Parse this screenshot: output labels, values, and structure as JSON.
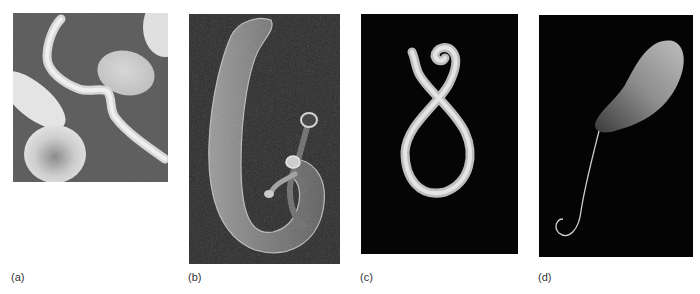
{
  "figure": {
    "panels": [
      {
        "id": "a",
        "label": "(a)",
        "subject": "trypanosome-among-red-blood-cells",
        "background": "#5b5b5b"
      },
      {
        "id": "b",
        "label": "(b)",
        "subject": "schistosome-fluke-pair",
        "background": "#2a2a2a"
      },
      {
        "id": "c",
        "label": "(c)",
        "subject": "coiled-roundworm",
        "background": "#050505"
      },
      {
        "id": "d",
        "label": "(d)",
        "subject": "flagellated-protozoan",
        "background": "#040404"
      }
    ]
  }
}
